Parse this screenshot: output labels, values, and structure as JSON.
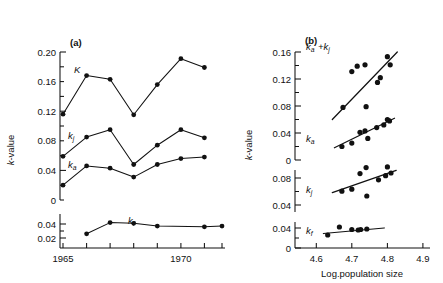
{
  "figure": {
    "panel_a_label": "(a)",
    "panel_b_label": "(b)",
    "ylabel_a": "k-value",
    "ylabel_b": "k-value",
    "xlabel_b": "Log.population size",
    "xlabel_a": ""
  },
  "chart_data": [
    {
      "type": "line",
      "panel": "(a)",
      "title": "(a)",
      "xlabel": "",
      "ylabel": "k-value",
      "xlim": [
        1964.6,
        1972.4
      ],
      "x_ticks": [
        1965,
        1966,
        1967,
        1968,
        1969,
        1970,
        1971,
        1972
      ],
      "x_tick_labels": [
        "1965",
        "",
        "",
        "",
        "",
        "1970",
        "",
        ""
      ],
      "grid": false,
      "legend": "inline-curve-labels",
      "subpanels": [
        {
          "name": "upper",
          "ylim": [
            0,
            0.2
          ],
          "y_ticks": [
            0,
            0.04,
            0.08,
            0.12,
            0.16,
            0.2
          ],
          "y_tick_labels": [
            "0",
            "0.04",
            "0.08",
            "0.12",
            "0.16",
            "0.20"
          ],
          "series": [
            {
              "name": "K",
              "label": "K",
              "x": [
                1965,
                1966,
                1967,
                1968,
                1969,
                1970,
                1971
              ],
              "values": [
                0.116,
                0.168,
                0.163,
                0.115,
                0.156,
                0.191,
                0.179
              ]
            },
            {
              "name": "k_j",
              "label": "kj",
              "x": [
                1965,
                1966,
                1967,
                1968,
                1969,
                1970,
                1971
              ],
              "values": [
                0.059,
                0.085,
                0.095,
                0.048,
                0.074,
                0.095,
                0.084
              ]
            },
            {
              "name": "k_a",
              "label": "ka",
              "x": [
                1965,
                1966,
                1967,
                1968,
                1969,
                1970,
                1971
              ],
              "values": [
                0.02,
                0.046,
                0.043,
                0.031,
                0.048,
                0.056,
                0.058
              ]
            }
          ]
        },
        {
          "name": "lower",
          "ylim": [
            0,
            0.05
          ],
          "y_ticks": [
            0.02,
            0.04
          ],
          "y_tick_labels": [
            "0.02",
            "0.04"
          ],
          "series": [
            {
              "name": "k_f",
              "label": "kf",
              "x": [
                1966,
                1967,
                1968,
                1969,
                1971,
                1972
              ],
              "values": [
                0.026,
                0.042,
                0.041,
                0.037,
                0.036,
                0.037
              ]
            }
          ]
        }
      ]
    },
    {
      "type": "scatter",
      "panel": "(b)",
      "title": "(b)",
      "xlabel": "Log.population size",
      "ylabel": "k-value",
      "xlim": [
        4.54,
        4.92
      ],
      "x_ticks": [
        4.6,
        4.7,
        4.8,
        4.9
      ],
      "x_tick_labels": [
        "4.6",
        "4.7",
        "4.8",
        "4.9"
      ],
      "grid": false,
      "subpanels": [
        {
          "name": "upper",
          "ylim": [
            0,
            0.17
          ],
          "y_ticks": [
            0,
            0.04,
            0.08,
            0.12,
            0.16
          ],
          "y_tick_labels": [
            "0",
            "0.04",
            "0.08",
            "0.12",
            "0.16"
          ],
          "series": [
            {
              "name": "k_a+k_j",
              "label": "ka +kj",
              "x": [
                4.675,
                4.7,
                4.715,
                4.737,
                4.74,
                4.772,
                4.78,
                4.8,
                4.808
              ],
              "values": [
                0.078,
                0.131,
                0.139,
                0.141,
                0.079,
                0.115,
                0.122,
                0.153,
                0.141
              ],
              "fit_line": {
                "x": [
                  4.645,
                  4.828
                ],
                "y": [
                  0.06,
                  0.16
                ]
              }
            },
            {
              "name": "k_a",
              "label": "ka",
              "x": [
                4.672,
                4.7,
                4.723,
                4.737,
                4.745,
                4.77,
                4.79,
                4.8,
                4.806
              ],
              "values": [
                0.02,
                0.025,
                0.041,
                0.043,
                0.032,
                0.048,
                0.052,
                0.06,
                0.058
              ],
              "fit_line": {
                "x": [
                  4.65,
                  4.82
                ],
                "y": [
                  0.018,
                  0.062
                ]
              }
            }
          ]
        },
        {
          "name": "middle",
          "ylim": [
            0.02,
            0.105
          ],
          "y_ticks": [
            0.04,
            0.08
          ],
          "y_tick_labels": [
            "0.04",
            "0.08"
          ],
          "series": [
            {
              "name": "k_j",
              "label": "kj",
              "x": [
                4.672,
                4.7,
                4.723,
                4.74,
                4.742,
                4.775,
                4.795,
                4.8,
                4.81
              ],
              "values": [
                0.059,
                0.062,
                0.085,
                0.094,
                0.052,
                0.076,
                0.082,
                0.095,
                0.086
              ],
              "fit_line": {
                "x": [
                  4.645,
                  4.825
                ],
                "y": [
                  0.057,
                  0.09
                ]
              }
            }
          ]
        },
        {
          "name": "lower",
          "ylim": [
            0,
            0.05
          ],
          "y_ticks": [
            0,
            0.04
          ],
          "y_tick_labels": [
            "0",
            "0.04"
          ],
          "series": [
            {
              "name": "k_f",
              "label": "kf",
              "x": [
                4.632,
                4.665,
                4.7,
                4.718,
                4.725,
                4.742
              ],
              "values": [
                0.026,
                0.042,
                0.037,
                0.036,
                0.037,
                0.038
              ],
              "fit_line": {
                "x": [
                  4.62,
                  4.79
                ],
                "y": [
                  0.029,
                  0.04
                ]
              }
            }
          ]
        }
      ]
    }
  ]
}
